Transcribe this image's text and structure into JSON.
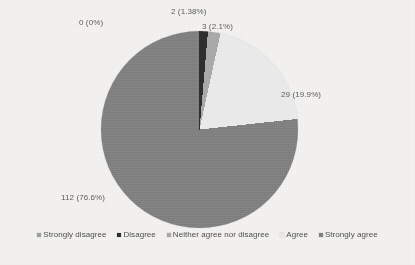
{
  "figure": {
    "background_color": "#f4f3f1",
    "text_color": "#5c5c5c"
  },
  "chart_data": {
    "type": "pie",
    "title": "",
    "subtitle": "",
    "xlabel": "",
    "ylabel": "",
    "legend_position": "bottom",
    "grid": false,
    "total": 146,
    "categories": [
      "Strongly disagree",
      "Disagree",
      "Neither agree nor disagree",
      "Agree",
      "Strongly agree"
    ],
    "values": [
      0,
      2,
      3,
      29,
      112
    ],
    "percents": [
      0,
      1.38,
      2.1,
      19.9,
      76.6
    ],
    "data_labels": [
      "0 (0%)",
      "2 (1.38%)",
      "3 (2.1%)",
      "29 (19.9%)",
      "112 (76.6%)"
    ],
    "colors": [
      "#9e9e9e",
      "#2e2e2e",
      "#a9a9a9",
      "#e9e9e9",
      "#808080"
    ],
    "start_angle_deg": 0,
    "direction": "clockwise",
    "slices": [
      {
        "label": "Strongly disagree",
        "value": 0,
        "percent": 0,
        "data_label": "0 (0%)",
        "color": "#9e9e9e"
      },
      {
        "label": "Disagree",
        "value": 2,
        "percent": 1.38,
        "data_label": "2 (1.38%)",
        "color": "#2e2e2e"
      },
      {
        "label": "Neither agree nor disagree",
        "value": 3,
        "percent": 2.1,
        "data_label": "3 (2.1%)",
        "color": "#a9a9a9"
      },
      {
        "label": "Agree",
        "value": 29,
        "percent": 19.9,
        "data_label": "29 (19.9%)",
        "color": "#e9e9e9"
      },
      {
        "label": "Strongly agree",
        "value": 112,
        "percent": 76.6,
        "data_label": "112 (76.6%)",
        "color": "#808080"
      }
    ]
  },
  "legend": {
    "items": [
      {
        "label": "Strongly disagree",
        "color": "#9e9e9e"
      },
      {
        "label": "Disagree",
        "color": "#2e2e2e"
      },
      {
        "label": "Neither agree nor disagree",
        "color": "#a9a9a9"
      },
      {
        "label": "Agree",
        "color": "#e9e9e9"
      },
      {
        "label": "Strongly agree",
        "color": "#808080"
      }
    ]
  }
}
